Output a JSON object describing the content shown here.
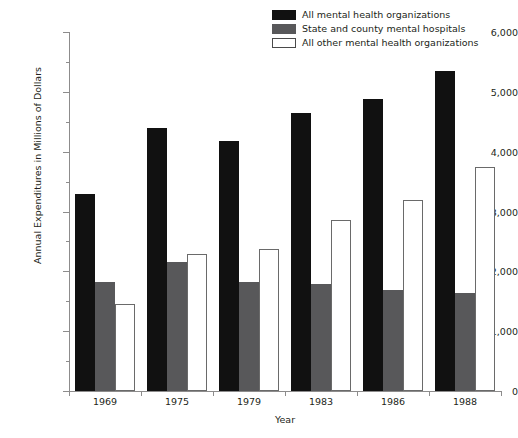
{
  "top_caption": "",
  "chart_data": {
    "type": "bar",
    "title": "",
    "xlabel": "Year",
    "ylabel": "Annual Expenditures in Millions of Dollars",
    "categories": [
      "1969",
      "1975",
      "1979",
      "1983",
      "1986",
      "1988"
    ],
    "series": [
      {
        "name": "All mental health organizations",
        "color": "#111111",
        "style": "black",
        "values": [
          3300,
          4400,
          4180,
          4650,
          4880,
          5350
        ]
      },
      {
        "name": "State and county mental hospitals",
        "color": "#58585a",
        "style": "gray",
        "values": [
          1830,
          2150,
          1820,
          1790,
          1690,
          1640
        ]
      },
      {
        "name": "All other mental health organizations",
        "color": "#ffffff",
        "style": "white",
        "values": [
          1450,
          2290,
          2370,
          2850,
          3200,
          3750
        ]
      }
    ],
    "ylim": [
      0,
      6000
    ],
    "ytick_values": [
      0,
      1000,
      2000,
      3000,
      4000,
      5000,
      6000
    ],
    "ytick_labels": [
      "0",
      "1,000",
      "2,000",
      "3,000",
      "4,000",
      "5,000",
      "6,000"
    ],
    "yminor_values": [
      500,
      1500,
      2500,
      3500,
      4500,
      5500
    ],
    "grid": false,
    "legend_position": "top-right"
  },
  "legend": {
    "items": [
      {
        "label": "All mental health organizations",
        "swatch": "sw-black"
      },
      {
        "label": "State and county mental hospitals",
        "swatch": "sw-gray"
      },
      {
        "label": "All other mental health organizations",
        "swatch": "sw-white"
      }
    ]
  }
}
